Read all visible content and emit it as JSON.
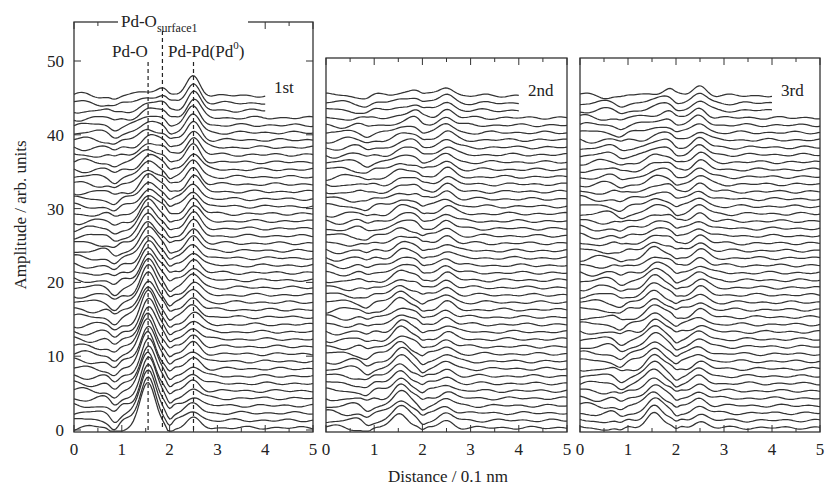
{
  "figure": {
    "ylabel": "Amplitude / arb. units",
    "xlabel": "Distance / 0.1 nm",
    "panel_labels": [
      "1st",
      "2nd",
      "3rd"
    ],
    "annotations": {
      "pd_o": "Pd-O",
      "pd_o_surface_main": "Pd-O",
      "pd_o_surface_sub": "surface1",
      "pd_pd_main": "Pd-Pd(Pd",
      "pd_pd_sup": "0",
      "pd_pd_close": ")"
    }
  },
  "chart_data": [
    {
      "type": "line",
      "title": "1st",
      "xlabel": "Distance / 0.1 nm",
      "ylabel": "Amplitude / arb. units",
      "xlim": [
        0,
        5
      ],
      "ylim": [
        0,
        55
      ],
      "xticks": [
        0,
        1,
        2,
        3,
        4,
        5
      ],
      "yticks": [
        0,
        10,
        20,
        30,
        40,
        50
      ],
      "series_count": 46,
      "offset_step": 1.0,
      "peaks": [
        {
          "name": "Pd-O",
          "r": 1.55,
          "amp_start": 6.0,
          "amp_end": 0.6
        },
        {
          "name": "Pd-Pd(Pd0)",
          "r": 2.5,
          "amp_start": 1.2,
          "amp_end": 2.6
        },
        {
          "name": "Pd-O surface1",
          "r": 1.85,
          "amp_start": 0.2,
          "amp_end": 1.0
        }
      ],
      "reference_lines": [
        {
          "label": "Pd-O",
          "x": 1.55
        },
        {
          "label": "Pd-O surface1",
          "x": 1.85
        },
        {
          "label": "Pd-Pd(Pd0)",
          "x": 2.5
        }
      ]
    },
    {
      "type": "line",
      "title": "2nd",
      "xlabel": "Distance / 0.1 nm",
      "xlim": [
        0,
        5
      ],
      "ylim": [
        0,
        50
      ],
      "xticks": [
        0,
        1,
        2,
        3,
        4,
        5
      ],
      "series_count": 46,
      "offset_step": 1.0,
      "peaks": [
        {
          "name": "Pd-O",
          "r": 1.55,
          "amp_start": 2.0,
          "amp_end": 0.3
        },
        {
          "name": "Pd-Pd",
          "r": 2.5,
          "amp_start": 0.9,
          "amp_end": 1.2
        },
        {
          "name": "Pd-O surface1",
          "r": 1.85,
          "amp_start": 0.1,
          "amp_end": 0.9
        }
      ]
    },
    {
      "type": "line",
      "title": "3rd",
      "xlabel": "Distance / 0.1 nm",
      "xlim": [
        0,
        5
      ],
      "ylim": [
        0,
        50
      ],
      "xticks": [
        0,
        1,
        2,
        3,
        4,
        5
      ],
      "series_count": 46,
      "offset_step": 1.0,
      "peaks": [
        {
          "name": "Pd-O",
          "r": 1.55,
          "amp_start": 2.2,
          "amp_end": 0.3
        },
        {
          "name": "Pd-Pd",
          "r": 2.5,
          "amp_start": 0.9,
          "amp_end": 1.3
        },
        {
          "name": "Pd-O surface1",
          "r": 1.85,
          "amp_start": 0.1,
          "amp_end": 0.9
        }
      ]
    }
  ]
}
